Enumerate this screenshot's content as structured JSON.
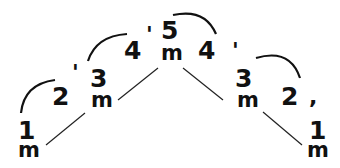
{
  "diagram": {
    "stroke_color": "#111111",
    "nodes": [
      {
        "id": "n1l",
        "number": "1",
        "unit": "m"
      },
      {
        "id": "n2l",
        "number": "2",
        "mark": "'"
      },
      {
        "id": "n3l",
        "number": "3",
        "unit": "m"
      },
      {
        "id": "n4l",
        "number": "4",
        "mark": "'"
      },
      {
        "id": "n5",
        "number": "5",
        "unit": "m"
      },
      {
        "id": "n4r",
        "number": "4",
        "mark": "'"
      },
      {
        "id": "n3r",
        "number": "3",
        "unit": "m"
      },
      {
        "id": "n2r",
        "number": "2",
        "mark": ","
      },
      {
        "id": "n1r",
        "number": "1",
        "unit": "m"
      }
    ],
    "arcs": [
      {
        "from": "n1l",
        "to": "n2l"
      },
      {
        "from": "n3l",
        "to": "n4l"
      },
      {
        "from": "n5",
        "to": "n4r"
      },
      {
        "from": "n3r",
        "to": "n2r"
      }
    ],
    "lines": [
      {
        "from": "n1l",
        "to": "n3l"
      },
      {
        "from": "n3l",
        "to": "n5"
      },
      {
        "from": "n5",
        "to": "n3r"
      },
      {
        "from": "n3r",
        "to": "n1r"
      }
    ]
  }
}
